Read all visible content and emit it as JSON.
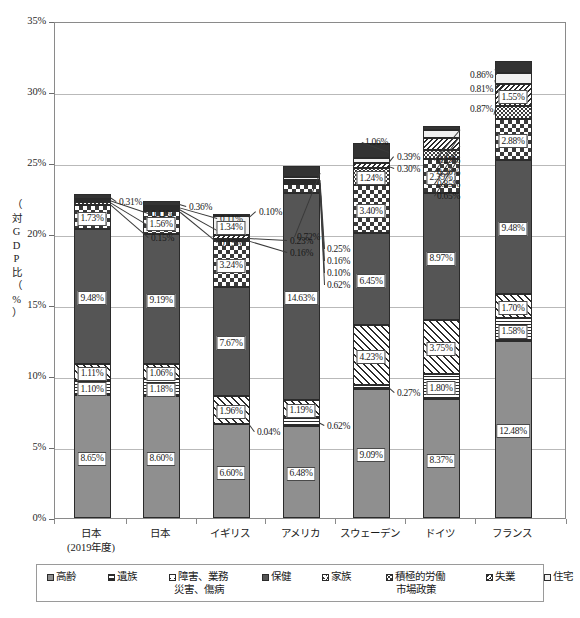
{
  "chart_data": {
    "type": "bar",
    "subtype": "stacked-bar",
    "title": "",
    "xlabel": "",
    "ylabel": "（対GDP比（%）",
    "ylabel_chars": [
      "（",
      "対",
      "G",
      "D",
      "P",
      "比",
      "（",
      "%",
      "）"
    ],
    "ylim": [
      0,
      35
    ],
    "ytick_values": [
      0,
      5,
      10,
      15,
      20,
      25,
      30,
      35
    ],
    "ytick_labels": [
      "0%",
      "5%",
      "10%",
      "15%",
      "20%",
      "25%",
      "30%",
      "35%"
    ],
    "grid": true,
    "legend_position": "bottom",
    "categories": [
      "日本\n(2019年度)",
      "日本",
      "イギリス",
      "アメリカ",
      "スウェーデン",
      "ドイツ",
      "フランス"
    ],
    "category_lines": [
      [
        "日本",
        "(2019年度)"
      ],
      [
        "日本",
        ""
      ],
      [
        "イギリス",
        ""
      ],
      [
        "アメリカ",
        ""
      ],
      [
        "スウェーデン",
        ""
      ],
      [
        "ドイツ",
        ""
      ],
      [
        "フランス",
        ""
      ]
    ],
    "series": [
      {
        "name": "高齢",
        "pattern": "solid-grey",
        "values": [
          8.65,
          8.6,
          6.6,
          6.48,
          9.09,
          8.37,
          12.48
        ]
      },
      {
        "name": "遺族",
        "pattern": "horizontal-lines",
        "values": [
          1.1,
          1.18,
          0.04,
          0.62,
          0.27,
          1.8,
          1.58
        ]
      },
      {
        "name": "障害、業務災害、傷病",
        "pattern": "diagonal-hatch",
        "values": [
          1.11,
          1.06,
          1.96,
          1.19,
          4.23,
          3.75,
          1.7
        ]
      },
      {
        "name": "保健",
        "pattern": "solid-dark",
        "values": [
          9.48,
          9.19,
          7.67,
          14.63,
          6.45,
          8.97,
          9.48
        ]
      },
      {
        "name": "家族",
        "pattern": "checkerboard",
        "values": [
          1.73,
          1.56,
          3.24,
          0.62,
          3.4,
          2.39,
          2.88
        ]
      },
      {
        "name": "積極的労働市場政策",
        "pattern": "dots",
        "values": [
          0.15,
          0.15,
          0.16,
          0.1,
          1.24,
          0.65,
          0.87
        ]
      },
      {
        "name": "失業",
        "pattern": "dense-diagonal",
        "values": [
          0.16,
          0.15,
          0.23,
          0.16,
          0.3,
          0.85,
          1.55
        ]
      },
      {
        "name": "住宅",
        "pattern": "light",
        "values": [
          0.11,
          0.11,
          1.34,
          0.25,
          0.39,
          0.56,
          0.81
        ]
      },
      {
        "name": "他の政策分野",
        "pattern": "near-black",
        "values": [
          0.31,
          0.36,
          0.1,
          0.72,
          1.06,
          0.29,
          0.86
        ]
      }
    ],
    "value_labels": {
      "0": [
        "8.65%",
        "1.10%",
        "1.11%",
        "9.48%",
        "1.73%",
        "0.15%",
        "0.16%",
        "0.11%",
        "0.31%"
      ],
      "1": [
        "8.60%",
        "1.18%",
        "1.06%",
        "9.19%",
        "1.56%",
        "0.15%",
        "0.15%",
        "0.11%",
        "0.36%"
      ],
      "2": [
        "6.60%",
        "0.04%",
        "1.96%",
        "7.67%",
        "3.24%",
        "0.16%",
        "0.23%",
        "1.34%",
        "0.10%"
      ],
      "3": [
        "6.48%",
        "0.62%",
        "1.19%",
        "14.63%",
        "0.62%",
        "0.10%",
        "0.16%",
        "0.25%",
        "0.72%"
      ],
      "4": [
        "9.09%",
        "0.27%",
        "4.23%",
        "6.45%",
        "3.40%",
        "1.24%",
        "0.30%",
        "0.39%",
        "1.06%"
      ],
      "5": [
        "8.37%",
        "1.80%",
        "3.75%",
        "8.97%",
        "2.39%",
        "0.65%",
        "0.85%",
        "0.56%",
        "0.29%"
      ],
      "6": [
        "12.48%",
        "1.58%",
        "1.70%",
        "9.48%",
        "2.88%",
        "0.87%",
        "1.55%",
        "0.81%",
        "0.86%"
      ]
    },
    "totals": [
      22.7,
      22.36,
      21.34,
      24.77,
      26.43,
      27.63,
      32.21
    ]
  },
  "legend": {
    "items": [
      {
        "label_line1": "高齢",
        "label_line2": "",
        "pattern": "solid-grey"
      },
      {
        "label_line1": "遺族",
        "label_line2": "",
        "pattern": "horizontal-lines"
      },
      {
        "label_line1": "障害、業務",
        "label_line2": "災害、傷病",
        "pattern": "diagonal-hatch"
      },
      {
        "label_line1": "保健",
        "label_line2": "",
        "pattern": "solid-dark"
      },
      {
        "label_line1": "家族",
        "label_line2": "",
        "pattern": "checkerboard"
      },
      {
        "label_line1": "積極的労働",
        "label_line2": "市場政策",
        "pattern": "dots"
      },
      {
        "label_line1": "失業",
        "label_line2": "",
        "pattern": "dense-diagonal"
      },
      {
        "label_line1": "住宅",
        "label_line2": "",
        "pattern": "light"
      },
      {
        "label_line1": "他の",
        "label_line2": "政策分野",
        "pattern": "near-black"
      }
    ]
  },
  "colors": {
    "grid": "#b9b9b9",
    "axis": "#8a8a8a",
    "text": "#1a1a1a",
    "kourei": "#8f8f8f",
    "hoken": "#555555",
    "hoka": "#333333",
    "jutaku": "#f1f1f1",
    "ink": "#2b2b2b"
  }
}
